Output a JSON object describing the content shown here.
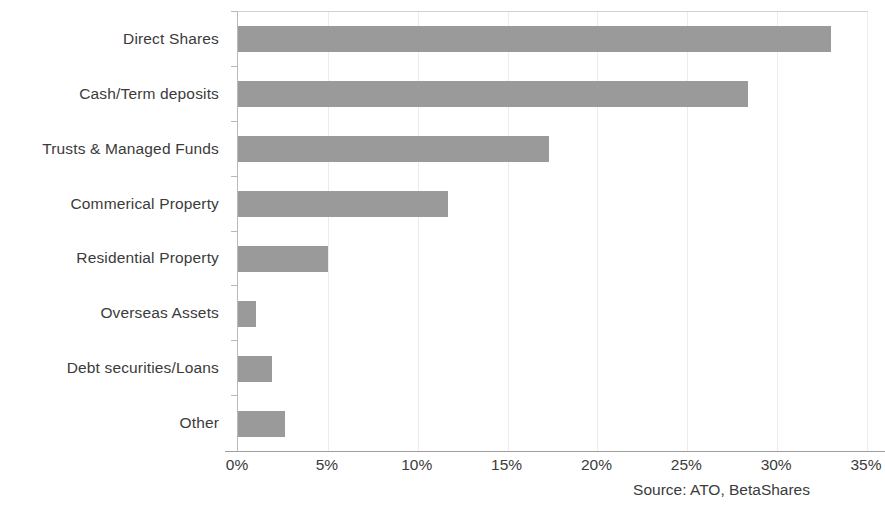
{
  "chart_data": {
    "type": "bar",
    "orientation": "horizontal",
    "title": "",
    "subtitle": "",
    "xlabel": "",
    "ylabel": "",
    "categories": [
      "Direct Shares",
      "Cash/Term deposits",
      "Trusts & Managed Funds",
      "Commerical Property",
      "Residential Property",
      "Overseas Assets",
      "Debt securities/Loans",
      "Other"
    ],
    "values": [
      33.0,
      28.4,
      17.3,
      11.7,
      5.0,
      1.0,
      1.9,
      2.6
    ],
    "value_unit": "%",
    "xlim": [
      0,
      35
    ],
    "x_tick_values": [
      0,
      5,
      10,
      15,
      20,
      25,
      30,
      35
    ],
    "x_tick_labels": [
      "0%",
      "5%",
      "10%",
      "15%",
      "20%",
      "25%",
      "30%",
      "35%"
    ],
    "grid": true,
    "grid_axis": "x",
    "legend": false,
    "legend_position": "none",
    "bar_color": "#9a9a9a",
    "annotations": [
      "Source: ATO, BetaShares"
    ]
  },
  "source_note": "Source: ATO, BetaShares",
  "colors": {
    "bar": "#9a9a9a",
    "gridline": "#ececec",
    "axis": "#9e9e9e",
    "text": "#3b3b3b",
    "background": "#ffffff"
  }
}
